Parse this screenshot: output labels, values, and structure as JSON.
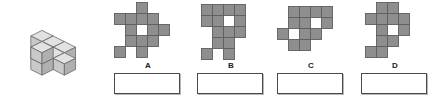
{
  "page": {
    "background_color": "#ffffff"
  },
  "colors": {
    "cell_fill": "#8e8e8e",
    "cell_stroke": "#5e5e5e",
    "cube_top": "#e2e2e2",
    "cube_left": "#c9c9c9",
    "cube_right": "#b0b0b0",
    "cube_stroke": "#6a6a6a",
    "box_border": "#4a4a4a",
    "text": "#1a1a1a"
  },
  "stimulus": {
    "name": "3d-cube-stack",
    "description": "Isometric stack of unit cubes",
    "cube_size": 13,
    "cubes": [
      {
        "x": 0,
        "y": 0,
        "z": 0
      },
      {
        "x": 1,
        "y": 0,
        "z": 0
      },
      {
        "x": 2,
        "y": 0,
        "z": 0
      },
      {
        "x": 1,
        "y": 1,
        "z": 0
      },
      {
        "x": 2,
        "y": 1,
        "z": 0
      },
      {
        "x": 3,
        "y": 1,
        "z": 0
      },
      {
        "x": 2,
        "y": 2,
        "z": 0
      },
      {
        "x": 2,
        "y": 2,
        "z": 1
      }
    ]
  },
  "options": [
    {
      "id": "A",
      "label": "A",
      "name": "option-a",
      "cell_size": 11,
      "grid_cols": 5,
      "grid_rows": 5,
      "offset_x": 9,
      "offset_y": 2,
      "cells": [
        [
          0,
          0,
          1,
          0,
          0
        ],
        [
          1,
          1,
          1,
          1,
          0
        ],
        [
          0,
          1,
          0,
          1,
          1
        ],
        [
          0,
          1,
          1,
          1,
          0
        ],
        [
          1,
          0,
          1,
          0,
          0
        ]
      ],
      "answer_box": {
        "name": "answer-box-a",
        "value": ""
      }
    },
    {
      "id": "B",
      "label": "B",
      "name": "option-b",
      "cell_size": 11,
      "grid_cols": 4,
      "grid_rows": 5,
      "offset_x": 13,
      "offset_y": 4,
      "cells": [
        [
          1,
          1,
          1,
          1
        ],
        [
          1,
          1,
          0,
          1
        ],
        [
          0,
          1,
          1,
          1
        ],
        [
          0,
          1,
          1,
          0
        ],
        [
          1,
          0,
          1,
          0
        ]
      ],
      "answer_box": {
        "name": "answer-box-b",
        "value": ""
      }
    },
    {
      "id": "C",
      "label": "C",
      "name": "option-c",
      "cell_size": 11,
      "grid_cols": 5,
      "grid_rows": 4,
      "offset_x": 9,
      "offset_y": 6,
      "cells": [
        [
          0,
          1,
          1,
          1,
          1
        ],
        [
          0,
          1,
          1,
          0,
          1
        ],
        [
          1,
          0,
          1,
          1,
          0
        ],
        [
          0,
          1,
          1,
          0,
          0
        ]
      ],
      "answer_box": {
        "name": "answer-box-c",
        "value": ""
      }
    },
    {
      "id": "D",
      "label": "D",
      "name": "option-d",
      "cell_size": 11,
      "grid_cols": 4,
      "grid_rows": 5,
      "offset_x": 13,
      "offset_y": 2,
      "cells": [
        [
          0,
          1,
          1,
          0
        ],
        [
          1,
          1,
          1,
          1
        ],
        [
          0,
          1,
          0,
          1
        ],
        [
          0,
          1,
          1,
          0
        ],
        [
          1,
          1,
          0,
          0
        ]
      ],
      "answer_box": {
        "name": "answer-box-d",
        "value": ""
      }
    }
  ],
  "layout": {
    "option_left_positions": [
      105,
      188,
      268,
      352
    ]
  }
}
